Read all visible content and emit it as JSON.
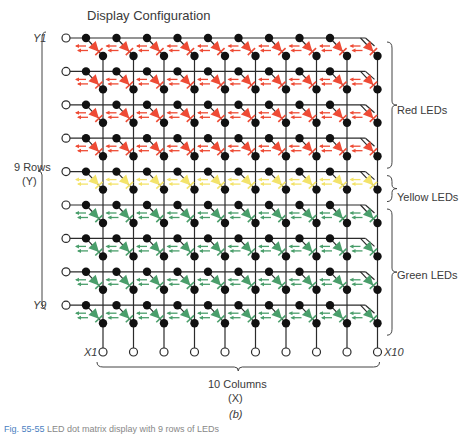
{
  "title": "Display Configuration",
  "rows": {
    "count": 9,
    "label": "9 Rows",
    "sublabel": "(Y)",
    "first_label": "Y1",
    "last_label": "Y9",
    "colors": [
      "red",
      "red",
      "red",
      "red",
      "yellow",
      "green",
      "green",
      "green",
      "green"
    ]
  },
  "columns": {
    "count": 10,
    "label": "10 Columns",
    "sublabel": "(X)",
    "first_label": "X1",
    "last_label": "X10"
  },
  "groups": [
    {
      "name": "Red LEDs",
      "color": "red",
      "rows": [
        1,
        4
      ]
    },
    {
      "name": "Yellow LEDs",
      "color": "yellow",
      "rows": [
        5,
        5
      ]
    },
    {
      "name": "Green LEDs",
      "color": "green",
      "rows": [
        6,
        9
      ]
    }
  ],
  "led_colors": {
    "red": "#ee4b35",
    "yellow": "#f3e36a",
    "green": "#4a9e6b"
  },
  "wire_color": "#2b2b2b",
  "node_color": "#111111",
  "subfigure_label": "(b)",
  "caption": {
    "fig": "Fig. 55-55",
    "text": "LED dot matrix display with 9 rows of LEDs"
  }
}
